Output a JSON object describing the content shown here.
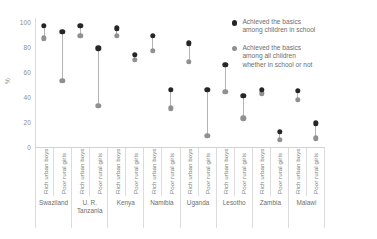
{
  "chart_data": {
    "type": "scatter",
    "subtype": "dumbbell",
    "title": "",
    "xlabel": "",
    "ylabel": "%",
    "ylim": [
      0,
      100
    ],
    "yticks": [
      0,
      20,
      40,
      60,
      80,
      100
    ],
    "grid": false,
    "legend_position": "right",
    "categories": [
      "Rich urban boys",
      "Poor rural girls",
      "Rich urban boys",
      "Poor rural girls",
      "Rich urban boys",
      "Poor rural girls",
      "Rich urban boys",
      "Poor rural girls",
      "Rich urban boys",
      "Poor rural girls",
      "Rich urban boys",
      "Poor rural girls",
      "Rich urban boys",
      "Poor rural girls",
      "Rich urban boys",
      "Poor rural girls"
    ],
    "groups": [
      {
        "label": "Swaziland",
        "span": 2
      },
      {
        "label": "U. R.\nTanzania",
        "span": 2
      },
      {
        "label": "Kenya",
        "span": 2
      },
      {
        "label": "Namibia",
        "span": 2
      },
      {
        "label": "Uganda",
        "span": 2
      },
      {
        "label": "Lesotho",
        "span": 2
      },
      {
        "label": "Zambia",
        "span": 2
      },
      {
        "label": "Malawi",
        "span": 2
      }
    ],
    "series": [
      {
        "name": "Achieved the basics\namong children in school",
        "color": "#262626",
        "values": [
          97,
          92,
          97,
          79,
          95,
          74,
          89,
          46,
          83,
          46,
          66,
          41,
          46,
          12,
          45,
          19
        ]
      },
      {
        "name": "Achieved the basics\namong all children\nwhether in school or not",
        "color": "#909090",
        "values": [
          87,
          53,
          89,
          33,
          89,
          70,
          77,
          31,
          68,
          9,
          44,
          23,
          43,
          6,
          38,
          7
        ]
      }
    ]
  },
  "legend": {
    "items": [
      {
        "marker": "dark",
        "text": "Achieved the basics\namong children in school"
      },
      {
        "marker": "light",
        "text": "Achieved the basics\namong all children\nwhether in school or not"
      }
    ]
  },
  "axis": {
    "y_label": "%"
  }
}
